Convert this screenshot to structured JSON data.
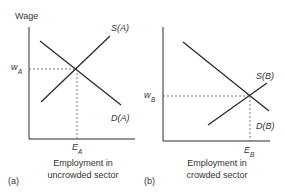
{
  "panel_a": {
    "y_axis_label": "Wage",
    "supply_label": "S(A)",
    "demand_label": "D(A)",
    "wage_label": "w",
    "wage_sub": "A",
    "emp_label": "E",
    "emp_sub": "A",
    "x_label_line1": "Employment in",
    "x_label_line2": "uncrowded sector",
    "panel_tag": "(a)"
  },
  "panel_b": {
    "supply_label": "S(B)",
    "demand_label": "D(B)",
    "wage_label": "w",
    "wage_sub": "B",
    "emp_label": "E",
    "emp_sub": "B",
    "x_label_line1": "Employment in",
    "x_label_line2": "crowded sector",
    "panel_tag": "(b)"
  },
  "colors": {
    "line": "#2a2a2a",
    "text": "#333333"
  }
}
